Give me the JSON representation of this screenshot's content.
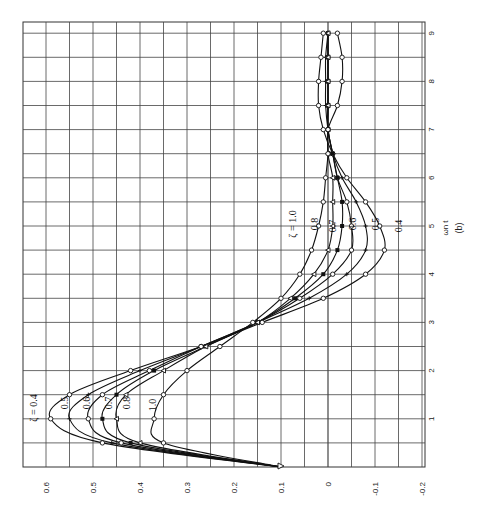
{
  "chart_data": {
    "type": "line",
    "orientation": "rotated-90-ccw",
    "title": "",
    "caption": "(b)",
    "xlabel": "ωn t",
    "ylabel": "",
    "xlim": [
      0,
      9.3
    ],
    "ylim": [
      -0.2,
      0.65
    ],
    "grid": true,
    "x_ticks": [
      1,
      2,
      3,
      4,
      5,
      6,
      7,
      8,
      9
    ],
    "x_tick_labels": [
      "1",
      "2",
      "3",
      "4",
      "5",
      "6",
      "7",
      "8",
      "9"
    ],
    "y_ticks": [
      0.6,
      0.5,
      0.4,
      0.3,
      0.2,
      0.1,
      0,
      -0.1,
      -0.2
    ],
    "y_tick_labels": [
      "0.6",
      "0.5",
      "0.4",
      "0.3",
      "0.2",
      "0.1",
      "0",
      "-0.1",
      "-0.2"
    ],
    "legend_position": "inline-labels",
    "x": [
      0,
      0.5,
      1.0,
      1.5,
      2.0,
      2.5,
      3.0,
      3.5,
      4.0,
      4.5,
      5.0,
      5.5,
      6.0,
      6.5,
      7.0,
      7.5,
      8.0,
      8.5,
      9.0
    ],
    "series": [
      {
        "name": "ζ = 0.4",
        "marker": "open-circle",
        "values": [
          0.1,
          0.48,
          0.59,
          0.55,
          0.42,
          0.27,
          0.14,
          0.01,
          -0.08,
          -0.12,
          -0.11,
          -0.08,
          -0.04,
          -0.01,
          0.01,
          0.02,
          0.02,
          0.015,
          0.01
        ]
      },
      {
        "name": "ζ = 0.5",
        "marker": "plus",
        "values": [
          0.1,
          0.46,
          0.55,
          0.51,
          0.4,
          0.27,
          0.15,
          0.04,
          -0.04,
          -0.08,
          -0.08,
          -0.06,
          -0.03,
          -0.01,
          0.0,
          0.005,
          0.005,
          0.005,
          0.0
        ]
      },
      {
        "name": "ζ = 0.6",
        "marker": "open-circle",
        "values": [
          0.1,
          0.44,
          0.51,
          0.48,
          0.38,
          0.27,
          0.15,
          0.06,
          -0.01,
          -0.05,
          -0.05,
          -0.04,
          -0.02,
          -0.01,
          0.0,
          0.0,
          0.0,
          0.0,
          0.0
        ]
      },
      {
        "name": "ζ = 0.7",
        "marker": "filled-square",
        "values": [
          0.1,
          0.42,
          0.48,
          0.45,
          0.37,
          0.26,
          0.15,
          0.07,
          0.01,
          -0.02,
          -0.03,
          -0.03,
          -0.02,
          -0.01,
          0.0,
          0.0,
          0.0,
          0.0,
          0.0
        ]
      },
      {
        "name": "ζ = 0.8",
        "marker": "open-triangle",
        "values": [
          0.1,
          0.4,
          0.45,
          0.43,
          0.35,
          0.26,
          0.15,
          0.08,
          0.03,
          0.0,
          -0.01,
          -0.01,
          -0.01,
          0.0,
          0.0,
          0.0,
          0.0,
          0.0,
          0.0
        ]
      },
      {
        "name": "ζ = 1.0",
        "marker": "open-circle",
        "values": [
          0.1,
          0.35,
          0.37,
          0.35,
          0.3,
          0.23,
          0.16,
          0.1,
          0.06,
          0.035,
          0.02,
          0.01,
          0.005,
          0.0,
          0.0,
          -0.02,
          -0.03,
          -0.03,
          -0.02
        ]
      }
    ],
    "annotations": [
      {
        "text": "ζ = 0.4",
        "near": "peak",
        "series": 0
      },
      {
        "text": "0.5",
        "near": "peak",
        "series": 1
      },
      {
        "text": "0.6",
        "near": "peak",
        "series": 2
      },
      {
        "text": "0.7",
        "near": "peak",
        "series": 3
      },
      {
        "text": "0.8",
        "near": "peak",
        "series": 4
      },
      {
        "text": "1.0",
        "near": "peak",
        "series": 5
      },
      {
        "text": "ζ = 1.0",
        "near": "trough",
        "series": 5
      },
      {
        "text": "0.8",
        "near": "trough",
        "series": 4
      },
      {
        "text": "0.7",
        "near": "trough",
        "series": 3
      },
      {
        "text": "0.6",
        "near": "trough",
        "series": 2
      },
      {
        "text": "0.5",
        "near": "trough",
        "series": 1
      },
      {
        "text": "0.4",
        "near": "trough",
        "series": 0
      }
    ]
  },
  "labels": {
    "xlabel": "ωn t",
    "caption": "(b)"
  }
}
